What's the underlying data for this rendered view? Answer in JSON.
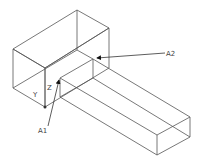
{
  "diagram": {
    "type": "isometric-wireframe",
    "labels": {
      "axis_y": "Y",
      "axis_z": "Z",
      "point_1": "A1",
      "point_2": "A2"
    },
    "colors": {
      "line": "#555555",
      "text": "#444444",
      "background": "#ffffff"
    }
  }
}
